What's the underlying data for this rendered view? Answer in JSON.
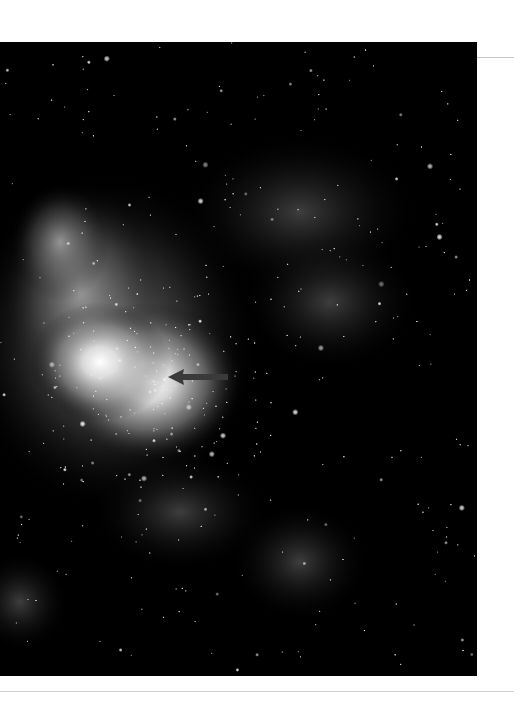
{
  "figure": {
    "colors": {
      "background": "#000000",
      "nebula": "#d8d8d8",
      "arrow": "#3a3a3a",
      "page": "#ffffff",
      "rule": "#cccccc"
    },
    "annotation": {
      "type": "arrow",
      "direction": "left",
      "target": "bright-cluster-core"
    }
  }
}
